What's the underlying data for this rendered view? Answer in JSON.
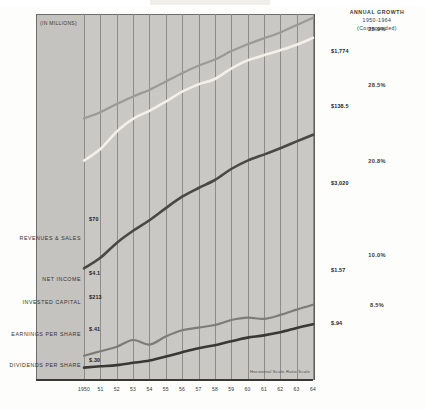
{
  "header": {
    "title": "ANNUAL GROWTH",
    "period": "1950-1964",
    "basis": "(Compounded)"
  },
  "units_label": "(IN MILLIONS)",
  "note": "Horizontal Scale Ratio Scale",
  "axis": {
    "years": [
      "1950",
      "51",
      "52",
      "53",
      "54",
      "55",
      "56",
      "57",
      "58",
      "59",
      "60",
      "61",
      "62",
      "63",
      "64"
    ]
  },
  "chart_data": {
    "type": "line",
    "title": "ANNUAL GROWTH 1950-1964 (Compounded)",
    "xlabel": "",
    "ylabel": "(IN MILLIONS)",
    "scale": "log",
    "grid": true,
    "legend": "left-labels",
    "x": [
      "1950",
      "51",
      "52",
      "53",
      "54",
      "55",
      "56",
      "57",
      "58",
      "59",
      "60",
      "61",
      "62",
      "63",
      "64"
    ],
    "series": [
      {
        "name": "REVENUES & SALES",
        "color": "#f2f0e8",
        "start_label": "$70",
        "end_label": "$1,774",
        "growth": "25.9%",
        "values": [
          70,
          95,
          150,
          210,
          260,
          330,
          430,
          520,
          600,
          790,
          980,
          1120,
          1280,
          1480,
          1774
        ]
      },
      {
        "name": "NET INCOME",
        "color": "#4a4844",
        "start_label": "$4.1",
        "end_label": "$138.5",
        "growth": "28.5%",
        "values": [
          4.1,
          5.4,
          8.0,
          11.0,
          14.5,
          20.0,
          27.0,
          34.0,
          42.0,
          56.0,
          70.0,
          82.0,
          97.0,
          116.0,
          138.5
        ]
      },
      {
        "name": "INVESTED CAPITAL",
        "color": "#9b9a95",
        "start_label": "$213",
        "end_label": "$3,020",
        "growth": "20.8%",
        "values": [
          213,
          250,
          310,
          380,
          450,
          560,
          700,
          850,
          1000,
          1250,
          1500,
          1750,
          2050,
          2480,
          3020
        ]
      },
      {
        "name": "EARNINGS PER SHARE",
        "color": "#7e7c77",
        "start_label": "$.41",
        "end_label": "$1.57",
        "growth": "10.0%",
        "values": [
          0.41,
          0.46,
          0.52,
          0.62,
          0.55,
          0.68,
          0.8,
          0.86,
          0.92,
          1.05,
          1.12,
          1.08,
          1.2,
          1.38,
          1.57
        ]
      },
      {
        "name": "DIVIDENDS PER SHARE",
        "color": "#3a3835",
        "start_label": "$.30",
        "end_label": "$.94",
        "growth": "8.5%",
        "values": [
          0.3,
          0.31,
          0.32,
          0.34,
          0.36,
          0.4,
          0.45,
          0.5,
          0.54,
          0.6,
          0.66,
          0.7,
          0.76,
          0.85,
          0.94
        ]
      }
    ]
  }
}
